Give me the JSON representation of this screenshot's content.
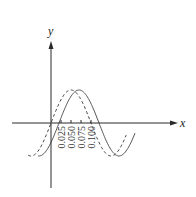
{
  "chart_data": {
    "type": "line",
    "title": "",
    "xlabel": "x",
    "ylabel": "y",
    "x_ticks": [
      0.025,
      0.05,
      0.075,
      0.1
    ],
    "x_tick_labels": [
      "0.025",
      "0.050",
      "0.075",
      "0.100"
    ],
    "xlim": [
      -0.1,
      0.325
    ],
    "ylim": [
      -1.6,
      1.9
    ],
    "grid": false,
    "legend": "none",
    "series": [
      {
        "name": "solid-wave",
        "style": "solid",
        "function": "A*sin(2*pi*(x - 0.02)/0.2)",
        "amplitude": 1.0,
        "period": 0.2,
        "phase_shift": 0.02,
        "x_range": [
          -0.032,
          0.21
        ]
      },
      {
        "name": "dashed-wave",
        "style": "dashed",
        "function": "A*sin(2*pi*x/0.2)",
        "amplitude": 1.0,
        "period": 0.2,
        "phase_shift": 0.0,
        "x_range": [
          -0.057,
          0.188
        ]
      }
    ]
  }
}
